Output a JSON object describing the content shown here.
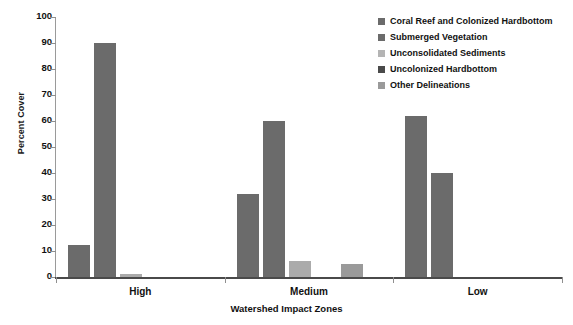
{
  "chart_data": {
    "type": "bar",
    "title": "",
    "xlabel": "Watershed Impact Zones",
    "ylabel": "Percent Cover",
    "categories": [
      "High",
      "Medium",
      "Low"
    ],
    "ylim": [
      0,
      100
    ],
    "yticks": [
      0,
      10,
      20,
      30,
      40,
      50,
      60,
      70,
      80,
      90,
      100
    ],
    "grid": false,
    "legend_position": "top-right",
    "series": [
      {
        "name": "Coral Reef and Colonized Hardbottom",
        "color": "#6b6b6b",
        "values": [
          12.5,
          32,
          62
        ]
      },
      {
        "name": "Submerged Vegetation",
        "color": "#6b6b6b",
        "values": [
          90,
          60,
          40
        ]
      },
      {
        "name": "Unconsolidated Sediments",
        "color": "#ababab",
        "values": [
          1,
          6,
          0
        ]
      },
      {
        "name": "Uncolonized Hardbottom",
        "color": "#4a4a4a",
        "values": [
          0,
          0,
          0
        ]
      },
      {
        "name": "Other Delineations",
        "color": "#9a9a9a",
        "values": [
          0,
          5,
          0
        ]
      }
    ]
  },
  "axis": {
    "y_title": "Percent Cover",
    "x_title": "Watershed Impact Zones",
    "y_tick_labels": [
      "100",
      "90",
      "80",
      "70",
      "60",
      "50",
      "40",
      "30",
      "20",
      "10",
      "0"
    ]
  },
  "categories": [
    {
      "label": "High"
    },
    {
      "label": "Medium"
    },
    {
      "label": "Low"
    }
  ],
  "legend": {
    "items": [
      {
        "label": "Coral Reef and Colonized Hardbottom",
        "color": "#6b6b6b"
      },
      {
        "label": "Submerged Vegetation",
        "color": "#6b6b6b"
      },
      {
        "label": "Unconsolidated Sediments",
        "color": "#b4b4b4"
      },
      {
        "label": "Uncolonized Hardbottom",
        "color": "#4a4a4a"
      },
      {
        "label": "Other Delineations",
        "color": "#9a9a9a"
      }
    ]
  }
}
